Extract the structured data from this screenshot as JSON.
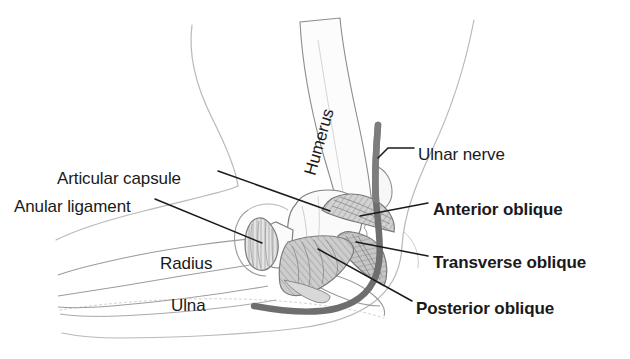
{
  "figure": {
    "view": "medial"
  },
  "colors": {
    "background": "#ffffff",
    "text": "#1a1a1a",
    "leader_line": "#1a1a1a",
    "skin_outline": "#b9b9b9",
    "bone_outline": "#6f6f6f",
    "bone_fill": "#fbfbfb",
    "ligament_fill": "#c9c9c9",
    "ligament_fill_light": "#dcdcdc",
    "ligament_outline": "#808080",
    "nerve": "#6e6e6e",
    "hatch": "#9a9a9a"
  },
  "labels": [
    {
      "id": "humerus",
      "text": "Humerus",
      "bold": false,
      "rotated": true,
      "x": 318,
      "y": 160
    },
    {
      "id": "articular-capsule",
      "text": "Articular capsule",
      "bold": false,
      "rotated": false,
      "x": 57,
      "y": 170
    },
    {
      "id": "anular-ligament",
      "text": "Anular ligament",
      "bold": false,
      "rotated": false,
      "x": 14,
      "y": 198
    },
    {
      "id": "radius",
      "text": "Radius",
      "bold": false,
      "rotated": false,
      "x": 160,
      "y": 255
    },
    {
      "id": "ulna",
      "text": "Ulna",
      "bold": false,
      "rotated": false,
      "x": 171,
      "y": 297
    },
    {
      "id": "ulnar-nerve",
      "text": "Ulnar nerve",
      "bold": false,
      "rotated": false,
      "x": 418,
      "y": 146
    },
    {
      "id": "anterior-oblique",
      "text": "Anterior oblique",
      "bold": true,
      "rotated": false,
      "x": 433,
      "y": 201
    },
    {
      "id": "transverse-oblique",
      "text": "Transverse oblique",
      "bold": true,
      "rotated": false,
      "x": 433,
      "y": 254
    },
    {
      "id": "posterior-oblique",
      "text": "Posterior oblique",
      "bold": true,
      "rotated": false,
      "x": 416,
      "y": 300
    }
  ],
  "structures": [
    {
      "id": "humerus-shaft",
      "name": "Humerus",
      "kind": "bone"
    },
    {
      "id": "radius-shaft",
      "name": "Radius",
      "kind": "bone"
    },
    {
      "id": "ulna-shaft",
      "name": "Ulna",
      "kind": "bone"
    },
    {
      "id": "articular-capsule",
      "name": "Articular capsule",
      "kind": "capsule"
    },
    {
      "id": "anular-ligament",
      "name": "Anular ligament",
      "kind": "ligament"
    },
    {
      "id": "anterior-oblique",
      "name": "Anterior oblique",
      "kind": "ligament-band"
    },
    {
      "id": "transverse-oblique",
      "name": "Transverse oblique",
      "kind": "ligament-band"
    },
    {
      "id": "posterior-oblique",
      "name": "Posterior oblique",
      "kind": "ligament-band"
    },
    {
      "id": "ulnar-nerve",
      "name": "Ulnar nerve",
      "kind": "nerve"
    }
  ]
}
